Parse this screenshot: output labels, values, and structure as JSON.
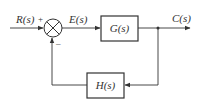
{
  "diagram": {
    "type": "closed-loop feedback block diagram",
    "input_label": "R(s)",
    "error_label": "E(s)",
    "output_label": "C(s)",
    "forward_block": "G(s)",
    "feedback_block": "H(s)",
    "summing_junction": {
      "plus_sign": "+",
      "minus_sign": "–"
    },
    "line_color": "#333333"
  }
}
